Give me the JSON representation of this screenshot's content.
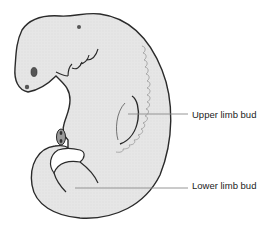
{
  "diagram": {
    "labels": [
      {
        "id": "upper-limb-bud",
        "text": "Upper limb bud"
      },
      {
        "id": "lower-limb-bud",
        "text": "Lower limb bud"
      }
    ],
    "colors": {
      "body_fill": "#e4e4e4",
      "outline": "#2a2a2a",
      "leader_line": "#8a8a8a",
      "somite_line": "#a0a0a0",
      "eye_fill": "#555555",
      "background": "#ffffff"
    }
  }
}
